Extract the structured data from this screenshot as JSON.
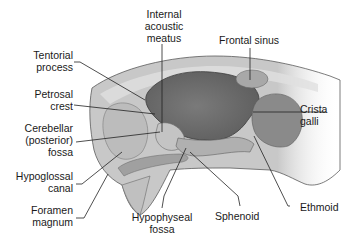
{
  "diagram": {
    "colors": {
      "background": "#ffffff",
      "bone_light": "#d6d6d6",
      "bone_mid": "#b4b4b4",
      "cavity_dark": "#6e6e6e",
      "cavity_mid": "#8c8c8c",
      "outline": "#4a4a4a",
      "leader_line": "#222222",
      "text": "#1a1a1a"
    },
    "labels": {
      "internal_acoustic_meatus": [
        "Internal",
        "acoustic",
        "meatus"
      ],
      "frontal_sinus": "Frontal sinus",
      "tentorial_process": [
        "Tentorial",
        "process"
      ],
      "petrosal_crest": [
        "Petrosal",
        "crest"
      ],
      "crista_galli": [
        "Crista",
        "galli"
      ],
      "cerebellar_fossa": [
        "Cerebellar",
        "(posterior)",
        "fossa"
      ],
      "hypoglossal_canal": [
        "Hypoglossal",
        "canal"
      ],
      "foramen_magnum": [
        "Foramen",
        "magnum"
      ],
      "hypophyseal_fossa": [
        "Hypophyseal",
        "fossa"
      ],
      "sphenoid": "Sphenoid",
      "ethmoid": "Ethmoid"
    }
  }
}
